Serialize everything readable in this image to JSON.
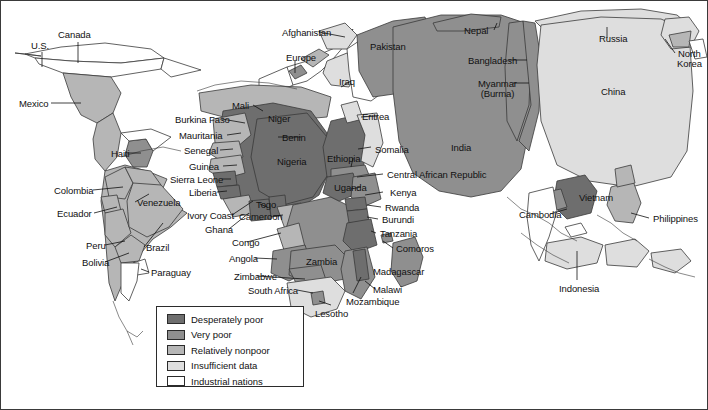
{
  "figure": {
    "type": "cartogram"
  },
  "legend": {
    "items": [
      {
        "label": "Desperately poor",
        "color": "#6e6e6e"
      },
      {
        "label": "Very poor",
        "color": "#8f8f8f"
      },
      {
        "label": "Relatively nonpoor",
        "color": "#b6b6b6"
      },
      {
        "label": "Insufficient data",
        "color": "#dedede"
      },
      {
        "label": "Industrial nations",
        "color": "#ffffff"
      }
    ]
  },
  "colors": {
    "desperately_poor": "#6e6e6e",
    "very_poor": "#8f8f8f",
    "relatively_nonpoor": "#b6b6b6",
    "insufficient_data": "#dedede",
    "industrial": "#ffffff",
    "outline": "#3a3a3a",
    "text": "#111111"
  },
  "regions": {
    "americas": [
      {
        "name": "U.S.",
        "x": 30,
        "y": 40,
        "category": "industrial"
      },
      {
        "name": "Canada",
        "x": 57,
        "y": 29,
        "category": "industrial"
      },
      {
        "name": "Mexico",
        "x": 18,
        "y": 98,
        "category": "relatively_nonpoor"
      },
      {
        "name": "Haiti",
        "x": 110,
        "y": 148,
        "category": "very_poor"
      },
      {
        "name": "Colombia",
        "x": 53,
        "y": 185,
        "category": "relatively_nonpoor"
      },
      {
        "name": "Venezuela",
        "x": 136,
        "y": 197,
        "category": "relatively_nonpoor"
      },
      {
        "name": "Ecuador",
        "x": 56,
        "y": 208,
        "category": "relatively_nonpoor"
      },
      {
        "name": "Peru",
        "x": 85,
        "y": 240,
        "category": "relatively_nonpoor"
      },
      {
        "name": "Brazil",
        "x": 145,
        "y": 242,
        "category": "relatively_nonpoor"
      },
      {
        "name": "Bolivia",
        "x": 81,
        "y": 257,
        "category": "relatively_nonpoor"
      },
      {
        "name": "Paraguay",
        "x": 150,
        "y": 267,
        "category": "relatively_nonpoor"
      }
    ],
    "africa": [
      {
        "name": "Mali",
        "x": 231,
        "y": 100,
        "category": "desperately_poor"
      },
      {
        "name": "Burkina Faso",
        "x": 174,
        "y": 114,
        "category": "desperately_poor"
      },
      {
        "name": "Niger",
        "x": 267,
        "y": 113,
        "category": "desperately_poor"
      },
      {
        "name": "Mauritania",
        "x": 178,
        "y": 130,
        "category": "relatively_nonpoor"
      },
      {
        "name": "Benin",
        "x": 281,
        "y": 132,
        "category": "desperately_poor"
      },
      {
        "name": "Senegal",
        "x": 183,
        "y": 145,
        "category": "relatively_nonpoor"
      },
      {
        "name": "Guinea",
        "x": 188,
        "y": 161,
        "category": "relatively_nonpoor"
      },
      {
        "name": "Nigeria",
        "x": 276,
        "y": 156,
        "category": "desperately_poor"
      },
      {
        "name": "Sierra Leone",
        "x": 169,
        "y": 174,
        "category": "desperately_poor"
      },
      {
        "name": "Liberia",
        "x": 188,
        "y": 187,
        "category": "desperately_poor"
      },
      {
        "name": "Ivory Coast",
        "x": 186,
        "y": 210,
        "category": "relatively_nonpoor"
      },
      {
        "name": "Togo",
        "x": 255,
        "y": 199,
        "category": "desperately_poor"
      },
      {
        "name": "Cameroon",
        "x": 238,
        "y": 211,
        "category": "relatively_nonpoor"
      },
      {
        "name": "Ghana",
        "x": 204,
        "y": 224,
        "category": "desperately_poor"
      },
      {
        "name": "Congo",
        "x": 231,
        "y": 237,
        "category": "relatively_nonpoor"
      },
      {
        "name": "Angola",
        "x": 228,
        "y": 253,
        "category": "very_poor"
      },
      {
        "name": "Ethiopia",
        "x": 326,
        "y": 153,
        "category": "desperately_poor"
      },
      {
        "name": "Somalia",
        "x": 374,
        "y": 144,
        "category": "insufficient_data"
      },
      {
        "name": "Eritrea",
        "x": 361,
        "y": 111,
        "category": "insufficient_data"
      },
      {
        "name": "Uganda",
        "x": 333,
        "y": 182,
        "category": "desperately_poor"
      },
      {
        "name": "Kenya",
        "x": 389,
        "y": 187,
        "category": "very_poor"
      },
      {
        "name": "Rwanda",
        "x": 384,
        "y": 202,
        "category": "desperately_poor"
      },
      {
        "name": "Burundi",
        "x": 381,
        "y": 214,
        "category": "desperately_poor"
      },
      {
        "name": "Tanzania",
        "x": 379,
        "y": 228,
        "category": "desperately_poor"
      },
      {
        "name": "Comoros",
        "x": 395,
        "y": 243,
        "category": "very_poor"
      },
      {
        "name": "Zambia",
        "x": 305,
        "y": 256,
        "category": "very_poor"
      },
      {
        "name": "Zimbabwe",
        "x": 233,
        "y": 271,
        "category": "very_poor"
      },
      {
        "name": "South Africa",
        "x": 247,
        "y": 285,
        "category": "relatively_nonpoor"
      },
      {
        "name": "Lesotho",
        "x": 314,
        "y": 308,
        "category": "very_poor"
      },
      {
        "name": "Mozambique",
        "x": 345,
        "y": 296,
        "category": "very_poor"
      },
      {
        "name": "Malawi",
        "x": 372,
        "y": 284,
        "category": "desperately_poor"
      },
      {
        "name": "Madagascar",
        "x": 372,
        "y": 266,
        "category": "very_poor"
      }
    ],
    "central_african_republic": {
      "name": "Central African Republic",
      "x": 386,
      "y": 169,
      "category": "very_poor"
    },
    "asia": [
      {
        "name": "Afghanistan",
        "x": 281,
        "y": 27,
        "category": "insufficient_data"
      },
      {
        "name": "Europe",
        "x": 285,
        "y": 52,
        "category": "industrial"
      },
      {
        "name": "Pakistan",
        "x": 369,
        "y": 41,
        "category": "very_poor"
      },
      {
        "name": "Iraq",
        "x": 338,
        "y": 76,
        "category": "insufficient_data"
      },
      {
        "name": "Nepal",
        "x": 463,
        "y": 25,
        "category": "very_poor"
      },
      {
        "name": "Bangladesh",
        "x": 467,
        "y": 55,
        "category": "very_poor"
      },
      {
        "name": "Myanmar\n(Burma)",
        "x": 477,
        "y": 78,
        "category": "very_poor"
      },
      {
        "name": "India",
        "x": 450,
        "y": 142,
        "category": "very_poor"
      },
      {
        "name": "Russia",
        "x": 598,
        "y": 33,
        "category": "insufficient_data"
      },
      {
        "name": "China",
        "x": 600,
        "y": 86,
        "category": "insufficient_data"
      },
      {
        "name": "North\nKorea",
        "x": 676,
        "y": 48,
        "category": "insufficient_data"
      },
      {
        "name": "Vietnam",
        "x": 578,
        "y": 192,
        "category": "desperately_poor"
      },
      {
        "name": "Cambodia",
        "x": 518,
        "y": 209,
        "category": "very_poor"
      },
      {
        "name": "Philippines",
        "x": 652,
        "y": 213,
        "category": "relatively_nonpoor"
      },
      {
        "name": "Indonesia",
        "x": 558,
        "y": 283,
        "category": "relatively_nonpoor"
      }
    ]
  }
}
